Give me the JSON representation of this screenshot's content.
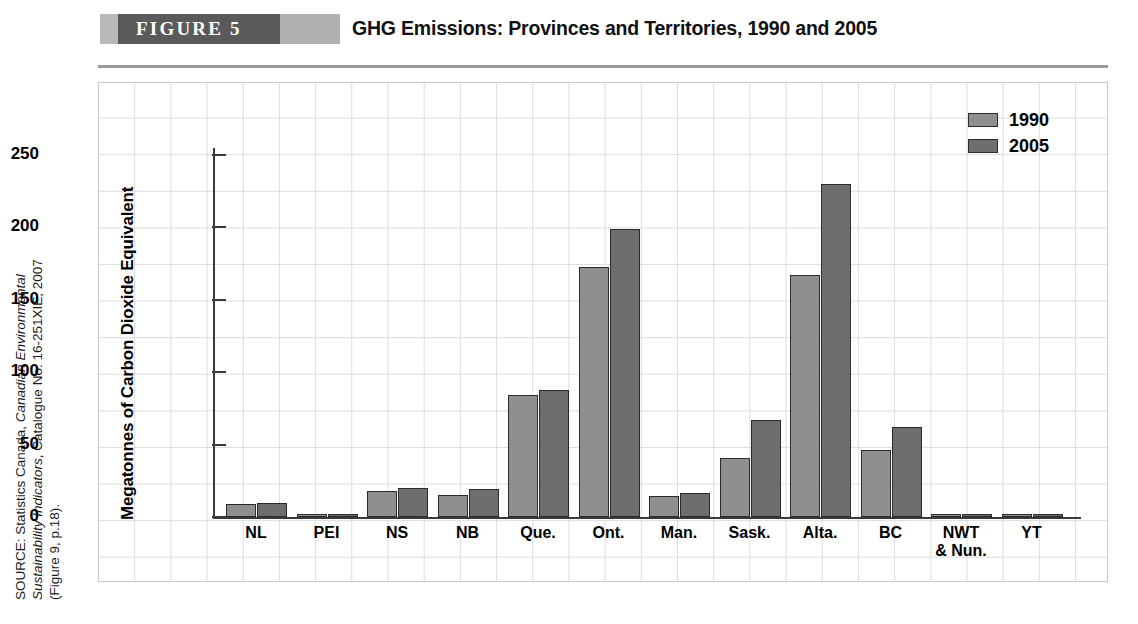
{
  "header": {
    "figure_badge": "FIGURE 5",
    "title": "GHG Emissions: Provinces and Territories, 1990 and 2005"
  },
  "source": {
    "line1": "SOURCE: Statistics Canada, Canadian Environmental",
    "line1_plain": "SOURCE: Statistics Canada, ",
    "line1_italic": "Canadian Environmental",
    "line2_italic": "Sustainability Indicators",
    "line2_plain": ", Catalogue No. 16-251XIE, 2007",
    "line3": "(Figure 9, p.18)."
  },
  "legend": {
    "position": "top-right",
    "entries": [
      {
        "label": "1990",
        "color": "#8f8f8f"
      },
      {
        "label": "2005",
        "color": "#6e6e6e"
      }
    ]
  },
  "chart_data": {
    "type": "bar",
    "title": "GHG Emissions: Provinces and Territories, 1990 and 2005",
    "xlabel": "",
    "ylabel": "Megatonnes of Carbon Dioxide Equivalent",
    "ylim": [
      0,
      270
    ],
    "yticks": [
      0,
      50,
      100,
      150,
      200,
      250
    ],
    "ytick_labels": [
      "0",
      "50",
      "100",
      "150",
      "200",
      "250"
    ],
    "grid": true,
    "categories": [
      "NL",
      "PEI",
      "NS",
      "NB",
      "Que.",
      "Ont.",
      "Man.",
      "Sask.",
      "Alta.",
      "BC",
      "NWT & Nun.",
      "YT"
    ],
    "category_labels_multiline": [
      [
        "NL"
      ],
      [
        "PEI"
      ],
      [
        "NS"
      ],
      [
        "NB"
      ],
      [
        "Que."
      ],
      [
        "Ont."
      ],
      [
        "Man."
      ],
      [
        "Sask."
      ],
      [
        "Alta."
      ],
      [
        "BC"
      ],
      [
        "NWT",
        "& Nun."
      ],
      [
        "YT"
      ]
    ],
    "series": [
      {
        "name": "1990",
        "color": "#8f8f8f",
        "values": [
          9,
          1.8,
          18,
          15,
          84,
          173,
          14.5,
          41,
          167,
          46,
          1.5,
          0.6
        ]
      },
      {
        "name": "2005",
        "color": "#6e6e6e",
        "values": [
          9.5,
          2,
          20,
          19.5,
          88,
          199,
          16.5,
          67,
          230,
          62,
          2,
          0.6
        ]
      }
    ]
  }
}
